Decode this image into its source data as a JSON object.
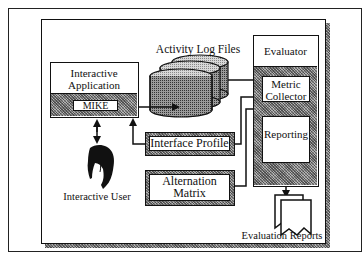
{
  "diagram": {
    "title": "",
    "nodes": {
      "interactive_application": {
        "label_line1": "Interactive",
        "label_line2": "Application"
      },
      "mike": {
        "label": "MIKE"
      },
      "activity_log_files": {
        "label": "Activity Log Files"
      },
      "evaluator": {
        "label": "Evaluator"
      },
      "metric_collector": {
        "label_line1": "Metric",
        "label_line2": "Collector"
      },
      "reporting": {
        "label": "Reporting"
      },
      "interface_profile": {
        "label": "Interface Profile"
      },
      "alternation_matrix": {
        "label_line1": "Alternation",
        "label_line2": "Matrix"
      },
      "interactive_user": {
        "label": "Interactive User"
      },
      "evaluation_reports": {
        "label": "Evaluation Reports"
      }
    },
    "edges": [
      {
        "from": "mike",
        "to": "activity_log_files"
      },
      {
        "from": "activity_log_files",
        "to": "metric_collector"
      },
      {
        "from": "interface_profile",
        "to": "metric_collector"
      },
      {
        "from": "alternation_matrix",
        "to": "metric_collector"
      },
      {
        "from": "interface_profile",
        "to": "interactive_application"
      },
      {
        "from": "interactive_user",
        "to": "interactive_application",
        "bidirectional": true
      },
      {
        "from": "reporting",
        "to": "evaluation_reports"
      }
    ],
    "colors": {
      "line": "#111111",
      "hatch": "#8a8a8a",
      "background": "#ffffff"
    }
  }
}
